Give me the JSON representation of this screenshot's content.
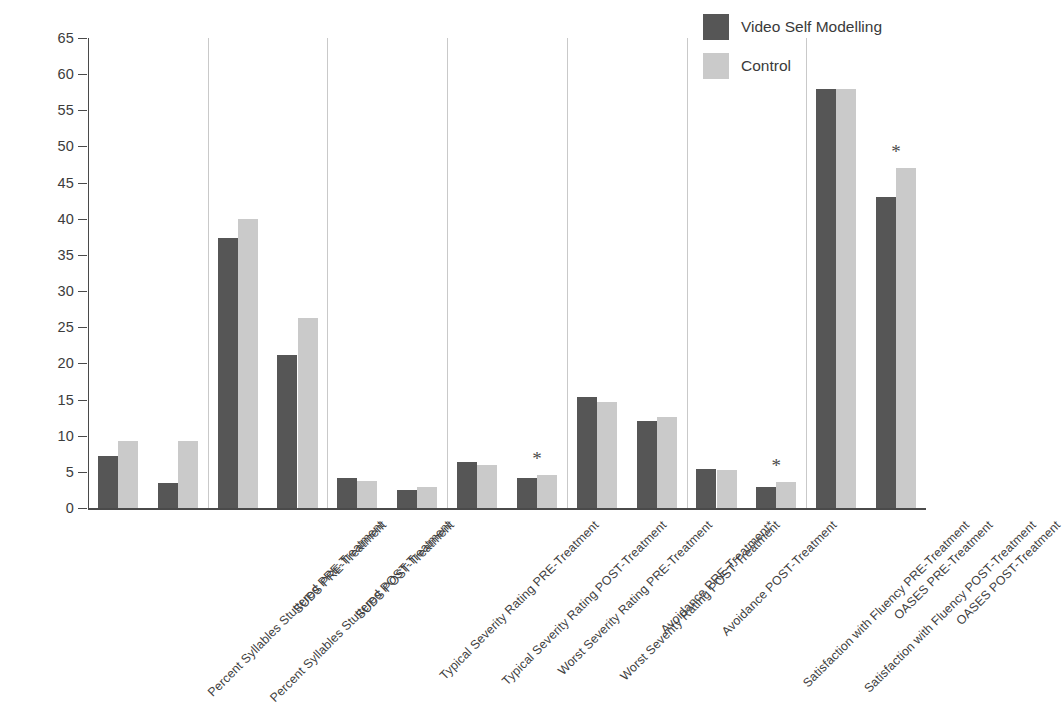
{
  "chart_data": {
    "type": "bar",
    "title": "",
    "subtitle": "",
    "xlabel": "",
    "ylabel": "",
    "ylim": [
      0,
      65
    ],
    "ytick_step": 5,
    "yticks": [
      0,
      5,
      10,
      15,
      20,
      25,
      30,
      35,
      40,
      45,
      50,
      55,
      60,
      65
    ],
    "grid": "vertical-group-separators-only",
    "legend_position": "top-right",
    "orientation": "vertical",
    "categories": [
      "Percent Syllables Stuttered PRE-Treatment",
      "Percent Syllables Stuttered POST-Treatment",
      "SUDS PRE-Treatment",
      "SUDS POST-Treatment",
      "Typical Severity Rating PRE-Treatment",
      "Typical Severity Rating POST-Treatment",
      "Worst Severity Rating PRE-Treatment",
      "Worst Severity Rating POST-Treatment",
      "Avoidance PRE-Treatment*",
      "Avoidance POST-Treatment",
      "Satisfaction with Fluency PRE-Treatment",
      "Satisfaction with Fluency POST-Treatment",
      "OASES PRE-Treatment",
      "OASES POST-Treatment"
    ],
    "series": [
      {
        "name": "Video Self Modelling",
        "color": "#565656",
        "values": [
          7.2,
          3.5,
          37.3,
          21.1,
          4.1,
          2.5,
          6.3,
          4.2,
          15.3,
          12.0,
          5.4,
          2.9,
          58.0,
          43.0
        ]
      },
      {
        "name": "Control",
        "color": "#cacaca",
        "values": [
          9.3,
          9.3,
          40.0,
          26.3,
          3.8,
          2.9,
          5.9,
          4.6,
          14.7,
          12.6,
          5.3,
          3.6,
          58.0,
          47.0
        ]
      }
    ],
    "annotations": [
      {
        "label": "*",
        "category_index": 7,
        "note": "significance marker above Worst Severity Rating POST-Treatment"
      },
      {
        "label": "*",
        "category_index": 11,
        "note": "significance marker above Satisfaction with Fluency POST-Treatment"
      },
      {
        "label": "*",
        "category_index": 13,
        "note": "significance marker above OASES POST-Treatment"
      }
    ],
    "group_separators_after_category": [
      1,
      3,
      5,
      7,
      9,
      11
    ]
  },
  "legend": {
    "items": [
      {
        "label": "Video Self Modelling",
        "swatch": "dark"
      },
      {
        "label": "Control",
        "swatch": "light"
      }
    ]
  },
  "colors": {
    "series_dark": "#565656",
    "series_light": "#cacaca",
    "axis": "#4a4a4a",
    "separator": "#c9c9c9",
    "text": "#3a3a3a",
    "background": "#ffffff"
  }
}
